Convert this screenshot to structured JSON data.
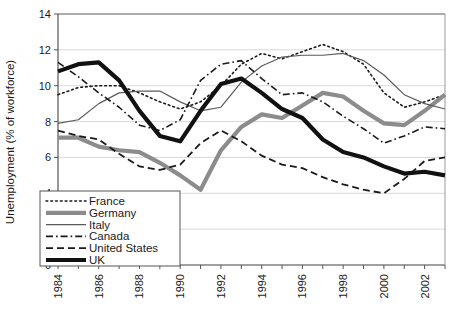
{
  "chart_data": {
    "type": "line",
    "title": "",
    "xlabel": "",
    "ylabel": "Unemployment (% of workforce)",
    "xlim": [
      1984,
      2003
    ],
    "ylim": [
      0,
      14
    ],
    "ytick_values": [
      0,
      2,
      4,
      6,
      8,
      10,
      12,
      14
    ],
    "ytick_labels": [
      "0",
      "2",
      "4",
      "6",
      "8",
      "10",
      "12",
      "14"
    ],
    "xtick_values": [
      1984,
      1986,
      1988,
      1990,
      1992,
      1994,
      1996,
      1998,
      2000,
      2002
    ],
    "xtick_labels": [
      "1984",
      "1986",
      "1988",
      "1990",
      "1992",
      "1994",
      "1996",
      "1998",
      "2000",
      "2002"
    ],
    "x": [
      1984,
      1985,
      1986,
      1987,
      1988,
      1989,
      1990,
      1991,
      1992,
      1993,
      1994,
      1995,
      1996,
      1997,
      1998,
      1999,
      2000,
      2001,
      2002,
      2003
    ],
    "grid": true,
    "legend_position": "lower-left",
    "series": [
      {
        "name": "France",
        "style": "dotted",
        "color": "#1a1a1a",
        "width": 1.6,
        "values": [
          9.5,
          9.9,
          10.0,
          10.0,
          9.6,
          9.1,
          8.7,
          9.1,
          10.0,
          11.2,
          11.8,
          11.5,
          11.9,
          12.3,
          11.9,
          11.2,
          9.6,
          8.8,
          9.1,
          9.5
        ]
      },
      {
        "name": "Germany",
        "style": "solid",
        "color": "#8c8c8c",
        "width": 4.2,
        "values": [
          7.1,
          7.1,
          6.6,
          6.4,
          6.3,
          5.7,
          5.0,
          4.2,
          6.4,
          7.7,
          8.4,
          8.2,
          8.9,
          9.6,
          9.4,
          8.6,
          7.9,
          7.8,
          8.6,
          9.5
        ]
      },
      {
        "name": "Italy",
        "style": "solid",
        "color": "#5a5a5a",
        "width": 1.2,
        "values": [
          7.9,
          8.1,
          9.0,
          9.6,
          9.7,
          9.7,
          9.1,
          8.6,
          8.8,
          10.2,
          11.1,
          11.6,
          11.7,
          11.7,
          11.8,
          11.4,
          10.6,
          9.5,
          9.0,
          8.7
        ]
      },
      {
        "name": "Canada",
        "style": "dashdot",
        "color": "#1a1a1a",
        "width": 1.6,
        "values": [
          11.3,
          10.5,
          9.6,
          8.8,
          7.8,
          7.5,
          8.1,
          10.3,
          11.2,
          11.4,
          10.4,
          9.5,
          9.6,
          9.1,
          8.3,
          7.6,
          6.8,
          7.2,
          7.7,
          7.6
        ]
      },
      {
        "name": "United States",
        "style": "dashed",
        "color": "#1a1a1a",
        "width": 1.8,
        "values": [
          7.5,
          7.2,
          7.0,
          6.2,
          5.5,
          5.3,
          5.6,
          6.8,
          7.5,
          6.9,
          6.1,
          5.6,
          5.4,
          4.9,
          4.5,
          4.2,
          4.0,
          4.8,
          5.8,
          6.0
        ]
      },
      {
        "name": "UK",
        "style": "solid",
        "color": "#111111",
        "width": 4.2,
        "values": [
          10.8,
          11.2,
          11.3,
          10.3,
          8.6,
          7.2,
          6.9,
          8.6,
          10.1,
          10.4,
          9.6,
          8.7,
          8.2,
          7.0,
          6.3,
          6.0,
          5.5,
          5.1,
          5.2,
          5.0
        ]
      }
    ]
  },
  "axis": {
    "ylabel": "Unemployment (% of workforce)"
  },
  "legend": {
    "entries": [
      {
        "label": "France"
      },
      {
        "label": "Germany"
      },
      {
        "label": "Italy"
      },
      {
        "label": "Canada"
      },
      {
        "label": "United States"
      },
      {
        "label": "UK"
      }
    ]
  }
}
